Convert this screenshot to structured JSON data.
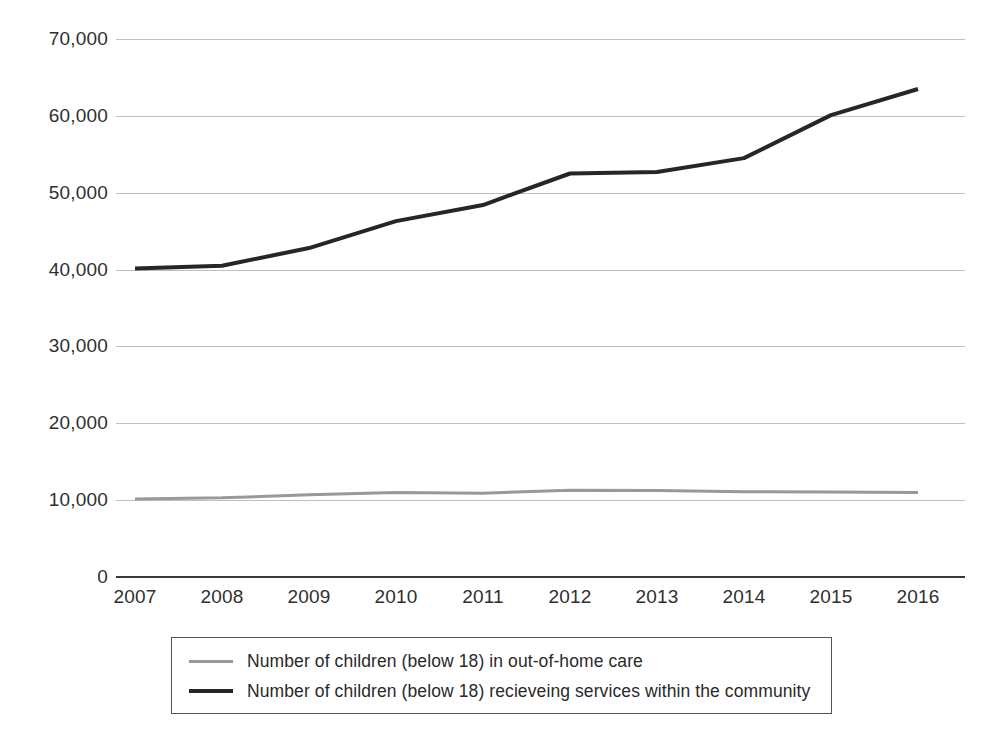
{
  "chart_data": {
    "type": "line",
    "title": "",
    "xlabel": "",
    "ylabel": "",
    "x": [
      "2007",
      "2008",
      "2009",
      "2010",
      "2011",
      "2012",
      "2013",
      "2014",
      "2015",
      "2016"
    ],
    "xtick_labels": [
      "2007",
      "2008",
      "2009",
      "2010",
      "2011",
      "2012",
      "2013",
      "2014",
      "2015",
      "2016"
    ],
    "ytick_labels": [
      "0",
      "10,000",
      "20,000",
      "30,000",
      "40,000",
      "50,000",
      "60,000",
      "70,000"
    ],
    "ytick_values": [
      0,
      10000,
      20000,
      30000,
      40000,
      50000,
      60000,
      70000
    ],
    "ylim": [
      0,
      70000
    ],
    "grid": true,
    "legend_position": "bottom",
    "series": [
      {
        "name": "Number of children (below 18) in out-of-home care",
        "color": "#999999",
        "width": 3,
        "values": [
          10150,
          10300,
          10700,
          11000,
          10900,
          11300,
          11250,
          11100,
          11050,
          11000
        ]
      },
      {
        "name": "Number of children (below 18) recieveing services within the community",
        "color": "#262626",
        "width": 4,
        "values": [
          40150,
          40500,
          42800,
          46300,
          48400,
          52500,
          52700,
          54500,
          60100,
          63500
        ]
      }
    ]
  },
  "legend": {
    "items": [
      {
        "label": "Number of children (below 18) in out-of-home care",
        "color": "#999999"
      },
      {
        "label": "Number of children (below 18) recieveing services within the community",
        "color": "#262626"
      }
    ]
  },
  "axes": {
    "gridline_color": "#bfbfbf",
    "axis_color": "#3a3a3a"
  }
}
